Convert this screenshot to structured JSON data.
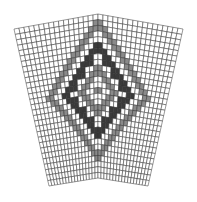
{
  "diagram": {
    "type": "knitting-chart",
    "colors": {
      "background": "#ffffff",
      "empty": "#ffffff",
      "gray": "#8a8a8a",
      "dark": "#3a3a3a",
      "grid_line": "#333333"
    },
    "grid": {
      "cols": 17,
      "rows": 29
    },
    "panels": [
      {
        "id": "left",
        "corners": {
          "tl": [
            14,
            29
          ],
          "tr": [
            98,
            14
          ],
          "br": [
            98,
            178
          ],
          "bl": [
            49,
            186
          ]
        }
      },
      {
        "id": "right",
        "corners": {
          "tl": [
            98,
            14
          ],
          "tr": [
            183,
            29
          ],
          "br": [
            148,
            186
          ],
          "bl": [
            98,
            178
          ]
        }
      }
    ],
    "motif": {
      "outer_diamond": {
        "center_col": 17,
        "center_row": 13,
        "radius": 12,
        "color": "gray"
      },
      "inner_diamond": {
        "center_col": 17,
        "center_row": 13,
        "radius": 8,
        "color": "dark"
      },
      "core_diamond": {
        "center_col": 17,
        "center_row": 13,
        "radius": 4,
        "color": "gray"
      }
    }
  }
}
